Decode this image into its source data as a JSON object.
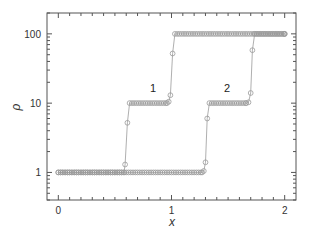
{
  "chart_data": {
    "type": "line",
    "title": "",
    "xlabel": "x",
    "ylabel": "ρ",
    "xlim": [
      -0.1,
      2.1
    ],
    "ylim": [
      0.4,
      200
    ],
    "yscale": "log",
    "x_ticks": [
      0,
      1,
      2
    ],
    "x_tick_labels": [
      "0",
      "1",
      "2"
    ],
    "x_minor_step": 0.1,
    "y_ticks": [
      1,
      10,
      100
    ],
    "y_tick_labels": [
      "1",
      "10",
      "100"
    ],
    "grid": false,
    "legend": null,
    "marker": "open-circle",
    "line_color": "#9a9a9a",
    "marker_color": "#9a9a9a",
    "annotations": [
      {
        "text": "1",
        "x": 0.83,
        "y": 20
      },
      {
        "text": "2",
        "x": 1.48,
        "y": 20
      }
    ],
    "series": [
      {
        "name": "1",
        "points": [
          [
            0.0,
            1
          ],
          [
            0.58,
            1
          ],
          [
            0.59,
            1.3
          ],
          [
            0.61,
            5.2
          ],
          [
            0.63,
            10
          ],
          [
            0.96,
            10
          ],
          [
            0.975,
            10.5
          ],
          [
            0.99,
            13
          ],
          [
            1.01,
            52
          ],
          [
            1.03,
            100
          ],
          [
            2.0,
            100
          ]
        ]
      },
      {
        "name": "2",
        "points": [
          [
            0.0,
            1
          ],
          [
            1.27,
            1
          ],
          [
            1.285,
            1.05
          ],
          [
            1.3,
            1.4
          ],
          [
            1.315,
            6
          ],
          [
            1.335,
            10
          ],
          [
            1.66,
            10
          ],
          [
            1.68,
            10.3
          ],
          [
            1.7,
            14
          ],
          [
            1.715,
            58
          ],
          [
            1.735,
            100
          ],
          [
            2.0,
            100
          ]
        ]
      }
    ]
  }
}
